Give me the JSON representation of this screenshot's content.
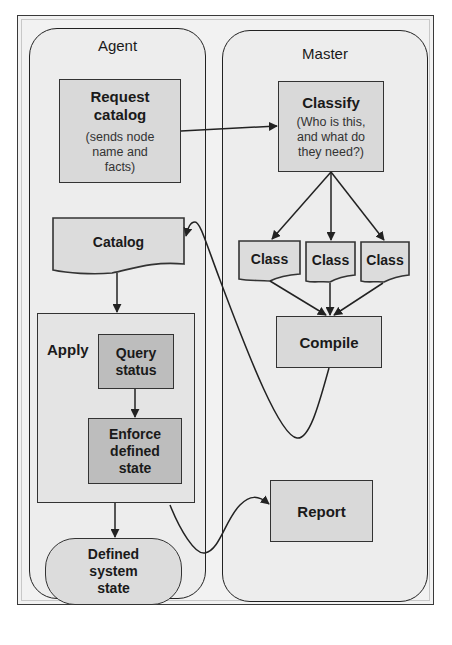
{
  "diagram": {
    "lanes": {
      "agent": {
        "title": "Agent"
      },
      "master": {
        "title": "Master"
      }
    },
    "agent_nodes": {
      "request_catalog": {
        "title_line1": "Request",
        "title_line2": "catalog",
        "subtitle_line1": "(sends node",
        "subtitle_line2": "name and",
        "subtitle_line3": "facts)"
      },
      "catalog": {
        "label": "Catalog"
      },
      "apply": {
        "label": "Apply",
        "query_status": {
          "line1": "Query",
          "line2": "status"
        },
        "enforce": {
          "line1": "Enforce",
          "line2": "defined",
          "line3": "state"
        }
      },
      "defined_system_state": {
        "line1": "Defined",
        "line2": "system",
        "line3": "state"
      }
    },
    "master_nodes": {
      "classify": {
        "title": "Classify",
        "subtitle_line1": "(Who is this,",
        "subtitle_line2": "and what do",
        "subtitle_line3": "they need?)"
      },
      "classes": [
        {
          "label": "Class"
        },
        {
          "label": "Class"
        },
        {
          "label": "Class"
        }
      ],
      "compile": {
        "label": "Compile"
      },
      "report": {
        "label": "Report"
      }
    },
    "edges": [
      {
        "from": "Request catalog",
        "to": "Classify"
      },
      {
        "from": "Classify",
        "to": "Class 1"
      },
      {
        "from": "Classify",
        "to": "Class 2"
      },
      {
        "from": "Classify",
        "to": "Class 3"
      },
      {
        "from": "Class 1",
        "to": "Compile"
      },
      {
        "from": "Class 2",
        "to": "Compile"
      },
      {
        "from": "Class 3",
        "to": "Compile"
      },
      {
        "from": "Compile",
        "to": "Catalog"
      },
      {
        "from": "Catalog",
        "to": "Apply"
      },
      {
        "from": "Query status",
        "to": "Enforce defined state"
      },
      {
        "from": "Apply",
        "to": "Defined system state"
      },
      {
        "from": "Apply",
        "to": "Report"
      }
    ],
    "colors": {
      "lane_fill": "#ededed",
      "box_fill": "#d9d9d9",
      "dark_box_fill": "#bdbdbd",
      "stroke": "#222222"
    }
  }
}
